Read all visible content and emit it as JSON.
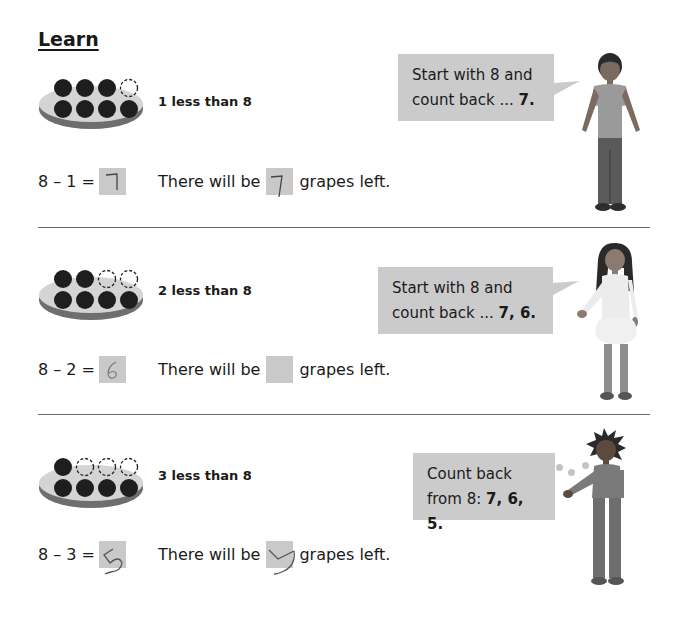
{
  "page": {
    "title": "Learn"
  },
  "sections": [
    {
      "caption": "1 less than 8",
      "grapes_total": 8,
      "grapes_removed": 1,
      "equation_prefix": "8 – 1 =",
      "equation_answer": "7",
      "sentence_before": "There will be",
      "sentence_answer": "7",
      "sentence_after": "grapes left.",
      "bubble_line1": "Start with 8 and",
      "bubble_line2_plain": "count back ... ",
      "bubble_line2_bold": "7.",
      "character": "boy-with-curly-hair"
    },
    {
      "caption": "2 less than 8",
      "grapes_total": 8,
      "grapes_removed": 2,
      "equation_prefix": "8 – 2 =",
      "equation_answer": "6",
      "sentence_before": "There will be",
      "sentence_answer": "",
      "sentence_after": "grapes left.",
      "bubble_line1": "Start with 8 and",
      "bubble_line2_plain": "count back ... ",
      "bubble_line2_bold": "7, 6.",
      "character": "girl-with-long-hair"
    },
    {
      "caption": "3 less than 8",
      "grapes_total": 8,
      "grapes_removed": 3,
      "equation_prefix": "8 – 3 =",
      "equation_answer": "5",
      "sentence_before": "There will be",
      "sentence_answer": "5",
      "sentence_after": "grapes left.",
      "bubble_line1": "Count back",
      "bubble_line2_plain": "from 8: ",
      "bubble_line2_bold": "7, 6, 5.",
      "character": "boy-with-spiky-hair",
      "bubble_type": "thought"
    }
  ],
  "colors": {
    "answer_box": "#c9c9c9",
    "speech_bubble": "#cbcbcb",
    "grape": "#1e1e1e",
    "plate_top": "#d4d4d4",
    "plate_rim": "#6e6e6e",
    "divider": "#6b6b6b"
  }
}
